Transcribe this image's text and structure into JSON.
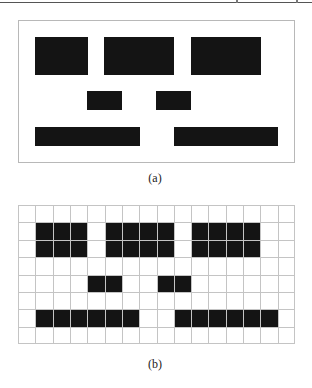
{
  "figure": {
    "panel_a": {
      "label": "(a)",
      "blocks": [
        {
          "x": 17,
          "y": 17,
          "w": 53,
          "h": 38
        },
        {
          "x": 86,
          "y": 17,
          "w": 70,
          "h": 38
        },
        {
          "x": 173,
          "y": 17,
          "w": 70,
          "h": 38
        },
        {
          "x": 69,
          "y": 71,
          "w": 35,
          "h": 19
        },
        {
          "x": 138,
          "y": 71,
          "w": 35,
          "h": 19
        },
        {
          "x": 17,
          "y": 107,
          "w": 105,
          "h": 19
        },
        {
          "x": 156,
          "y": 107,
          "w": 104,
          "h": 19
        }
      ]
    },
    "panel_b": {
      "label": "(b)",
      "grid": {
        "cols": 16,
        "rows": 8
      },
      "filled_cells": [
        {
          "col": 1,
          "row": 1,
          "cspan": 3,
          "rspan": 2
        },
        {
          "col": 5,
          "row": 1,
          "cspan": 4,
          "rspan": 2
        },
        {
          "col": 10,
          "row": 1,
          "cspan": 4,
          "rspan": 2
        },
        {
          "col": 4,
          "row": 4,
          "cspan": 2,
          "rspan": 1
        },
        {
          "col": 8,
          "row": 4,
          "cspan": 2,
          "rspan": 1
        },
        {
          "col": 1,
          "row": 6,
          "cspan": 6,
          "rspan": 1
        },
        {
          "col": 9,
          "row": 6,
          "cspan": 6,
          "rspan": 1
        }
      ]
    },
    "colors": {
      "block": "#141414",
      "grid_line": "#c4c4c4",
      "border": "#b8b8b8"
    }
  }
}
